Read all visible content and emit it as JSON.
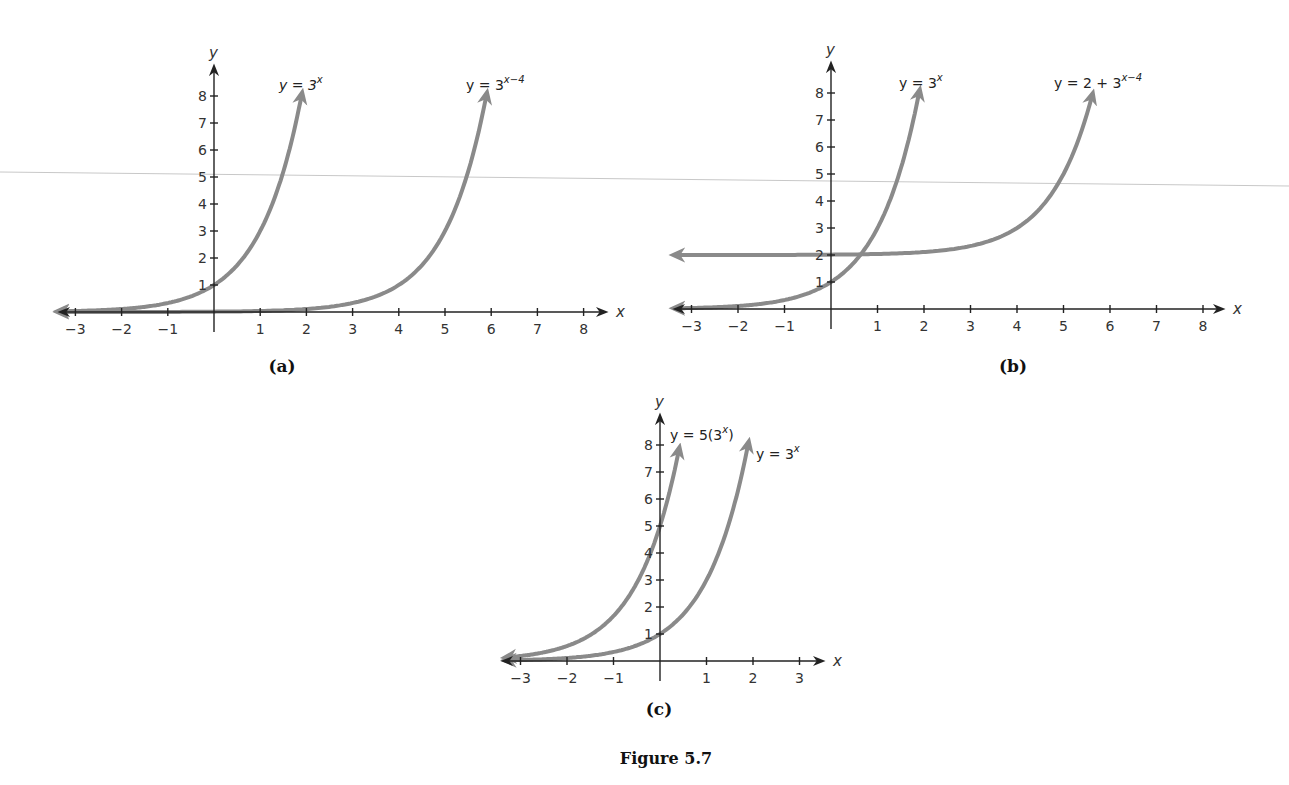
{
  "figure": {
    "caption": "Figure 5.7",
    "curve_color": "#8a8a8a",
    "axis_color": "#222222"
  },
  "chart_data": [
    {
      "type": "line",
      "panel": "(a)",
      "xlabel": "x",
      "ylabel": "y",
      "x_ticks": [
        "−3",
        "−2",
        "−1",
        "1",
        "2",
        "3",
        "4",
        "5",
        "6",
        "7",
        "8"
      ],
      "y_ticks": [
        "1",
        "2",
        "3",
        "4",
        "5",
        "6",
        "7",
        "8"
      ],
      "xlim": [
        -3,
        8
      ],
      "ylim": [
        0,
        8
      ],
      "grid": false,
      "series": [
        {
          "name": "y = 3^x",
          "label_base": "y = 3",
          "label_sup": "x",
          "function": "3^x",
          "x": [
            -3,
            -2,
            -1,
            0,
            1,
            1.5,
            1.9
          ],
          "y": [
            0.04,
            0.11,
            0.33,
            1,
            3,
            5.2,
            8.1
          ]
        },
        {
          "name": "y = 3^(x−4)",
          "label_base": "y = 3",
          "label_sup": "x−4",
          "function": "3^(x-4)",
          "x": [
            -3,
            0,
            2,
            3,
            4,
            5,
            5.5,
            5.9
          ],
          "y": [
            0,
            0.01,
            0.11,
            0.33,
            1,
            3,
            5.2,
            8.1
          ]
        }
      ]
    },
    {
      "type": "line",
      "panel": "(b)",
      "xlabel": "x",
      "ylabel": "y",
      "x_ticks": [
        "−3",
        "−2",
        "−1",
        "1",
        "2",
        "3",
        "4",
        "5",
        "6",
        "7",
        "8"
      ],
      "y_ticks": [
        "1",
        "2",
        "3",
        "4",
        "5",
        "6",
        "7",
        "8"
      ],
      "xlim": [
        -3,
        8
      ],
      "ylim": [
        0,
        8
      ],
      "grid": false,
      "series": [
        {
          "name": "y = 3^x",
          "label_base": "y = 3",
          "label_sup": "x",
          "function": "3^x",
          "x": [
            -3,
            -2,
            -1,
            0,
            0.63,
            1,
            1.5,
            1.9
          ],
          "y": [
            0.04,
            0.11,
            0.33,
            1,
            2,
            3,
            5.2,
            8.1
          ]
        },
        {
          "name": "y = 2 + 3^(x−4)",
          "label_base": "y = 2 + 3",
          "label_sup": "x−4",
          "function": "2+3^(x-4)",
          "x": [
            -3,
            0,
            2,
            3,
            4,
            5,
            5.6
          ],
          "y": [
            2,
            2.01,
            2.11,
            2.33,
            3,
            5,
            7.8
          ]
        }
      ]
    },
    {
      "type": "line",
      "panel": "(c)",
      "xlabel": "x",
      "ylabel": "y",
      "x_ticks": [
        "−3",
        "−2",
        "−1",
        "1",
        "2",
        "3"
      ],
      "y_ticks": [
        "1",
        "2",
        "3",
        "4",
        "5",
        "6",
        "7",
        "8"
      ],
      "xlim": [
        -3,
        3
      ],
      "ylim": [
        0,
        8
      ],
      "grid": false,
      "series": [
        {
          "name": "y = 5(3^x)",
          "label_base": "y = 5(3",
          "label_sup": "x",
          "label_tail": ")",
          "function": "5*3^x",
          "x": [
            -3,
            -2,
            -1,
            0,
            0.4
          ],
          "y": [
            0.19,
            0.56,
            1.67,
            5,
            7.76
          ]
        },
        {
          "name": "y = 3^x",
          "label_base": "y = 3",
          "label_sup": "x",
          "function": "3^x",
          "x": [
            -3,
            -2,
            -1,
            0,
            1,
            1.9
          ],
          "y": [
            0.04,
            0.11,
            0.33,
            1,
            3,
            8.1
          ]
        }
      ]
    }
  ],
  "panels": {
    "a": {
      "label": "(a)",
      "eq1_base": "y = 3",
      "eq1_sup": "x",
      "eq2_base": "y = 3",
      "eq2_sup": "x−4",
      "xlabel": "x",
      "ylabel": "y"
    },
    "b": {
      "label": "(b)",
      "eq1_base": "y = 3",
      "eq1_sup": "x",
      "eq2_base": "y = 2 + 3",
      "eq2_sup": "x−4",
      "xlabel": "x",
      "ylabel": "y"
    },
    "c": {
      "label": "(c)",
      "eq1_base": "y = 5(3",
      "eq1_sup": "x",
      "eq1_tail": ")",
      "eq2_base": "y = 3",
      "eq2_sup": "x",
      "xlabel": "x",
      "ylabel": "y"
    }
  }
}
